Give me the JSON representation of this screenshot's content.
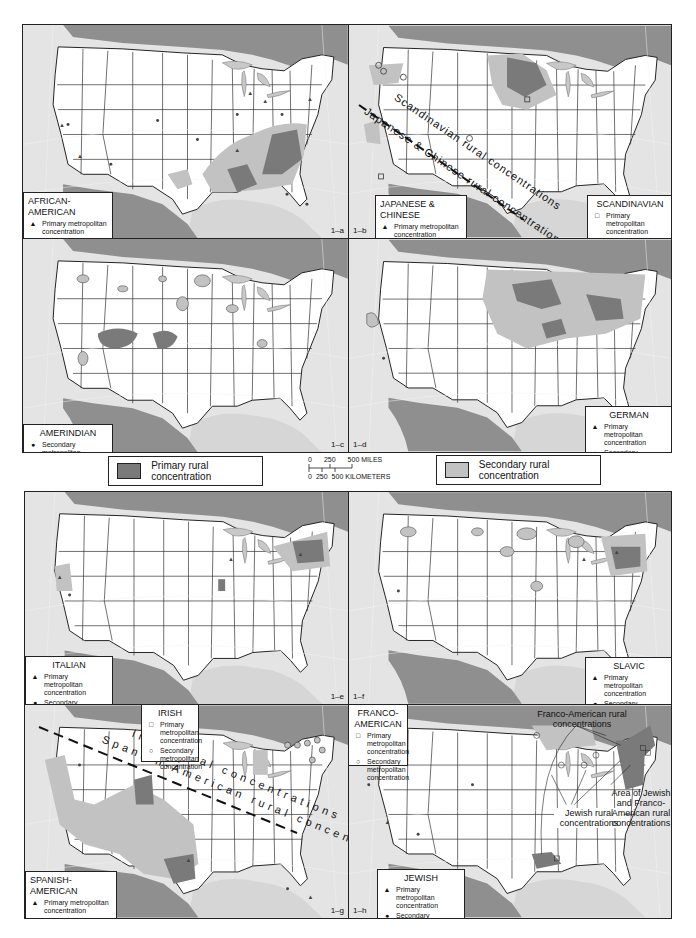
{
  "colors": {
    "primary_rural": "#7a7a7a",
    "secondary_rural": "#c2c2c2",
    "water": "#8f8f8f",
    "land_us": "#ffffff",
    "land_other": "#e4e4e4",
    "border": "#222222"
  },
  "common_legend": {
    "primary_label": "Primary rural concentration",
    "secondary_label": "Secondary rural concentration",
    "scale": {
      "miles_ticks": [
        "0",
        "250",
        "500 MILES"
      ],
      "km_ticks": [
        "0",
        "250",
        "500 KILOMETERS"
      ]
    }
  },
  "panels": [
    {
      "id": "1-a",
      "label": "1–a",
      "title": "AFRICAN-AMERICAN",
      "legend": [
        {
          "symbol": "triangle",
          "glyph": "▲",
          "text": "Primary metropolitan concentration"
        },
        {
          "symbol": "dot",
          "glyph": "●",
          "text": "Secondary metropolitan concentration"
        }
      ]
    },
    {
      "id": "1-b",
      "label": "1–b",
      "title": "JAPANESE & CHINESE",
      "legend": [
        {
          "symbol": "triangle",
          "glyph": "▲",
          "text": "Primary metropolitan concentration"
        },
        {
          "symbol": "dot",
          "glyph": "●",
          "text": "Secondary metropolitan concentration"
        }
      ],
      "second_title": "SCANDINAVIAN",
      "second_legend": [
        {
          "symbol": "square",
          "glyph": "□",
          "text": "Primary metropolitan concentration"
        },
        {
          "symbol": "circle",
          "glyph": "○",
          "text": "Secondary metropolitan concentration"
        }
      ],
      "annotations": [
        "Scandinavian rural concentrations",
        "Japanese & Chinese rural concentrations"
      ]
    },
    {
      "id": "1-c",
      "label": "1–c",
      "title": "AMERINDIAN",
      "legend": [
        {
          "symbol": "dot",
          "glyph": "●",
          "text": "Secondary metropolitan concentration"
        }
      ]
    },
    {
      "id": "1-d",
      "label": "1–d",
      "title": "GERMAN",
      "legend": [
        {
          "symbol": "triangle",
          "glyph": "▲",
          "text": "Primary metropolitan concentration"
        },
        {
          "symbol": "dot",
          "glyph": "●",
          "text": "Secondary metropolitan concentration"
        }
      ]
    },
    {
      "id": "1-e",
      "label": "1–e",
      "title": "ITALIAN",
      "legend": [
        {
          "symbol": "triangle",
          "glyph": "▲",
          "text": "Primary metropolitan concentration"
        },
        {
          "symbol": "dot",
          "glyph": "●",
          "text": "Secondary metropolitan concentration"
        }
      ]
    },
    {
      "id": "1-f",
      "label": "1–f",
      "title": "SLAVIC",
      "legend": [
        {
          "symbol": "triangle",
          "glyph": "▲",
          "text": "Primary metropolitan concentration"
        },
        {
          "symbol": "dot",
          "glyph": "●",
          "text": "Secondary metropolitan concentration"
        }
      ]
    },
    {
      "id": "1-g",
      "label": "1–g",
      "title": "SPANISH-AMERICAN",
      "legend": [
        {
          "symbol": "triangle",
          "glyph": "▲",
          "text": "Primary metropolitan concentration"
        },
        {
          "symbol": "dot",
          "glyph": "●",
          "text": "Secondary metropolitan concentration"
        }
      ],
      "second_title": "IRISH",
      "second_legend": [
        {
          "symbol": "square",
          "glyph": "□",
          "text": "Primary metropolitan concentration"
        },
        {
          "symbol": "circle",
          "glyph": "○",
          "text": "Secondary metropolitan concentration"
        }
      ],
      "annotations": [
        "Irish rural concentrations",
        "Spanish-American rural concentrations"
      ]
    },
    {
      "id": "1-h",
      "label": "1–h",
      "title": "JEWISH",
      "legend": [
        {
          "symbol": "triangle",
          "glyph": "▲",
          "text": "Primary metropolitan concentration"
        },
        {
          "symbol": "dot",
          "glyph": "●",
          "text": "Secondary metropolitan concentration"
        }
      ],
      "second_title": "FRANCO-AMERICAN",
      "second_legend": [
        {
          "symbol": "square",
          "glyph": "□",
          "text": "Primary metropolitan concentration"
        },
        {
          "symbol": "circle",
          "glyph": "○",
          "text": "Secondary metropolitan concentration"
        }
      ],
      "annotations": [
        "Franco-American rural concentrations",
        "Jewish rural concentrations",
        "Area of Jewish and Franco-American rural concentrations"
      ]
    }
  ]
}
